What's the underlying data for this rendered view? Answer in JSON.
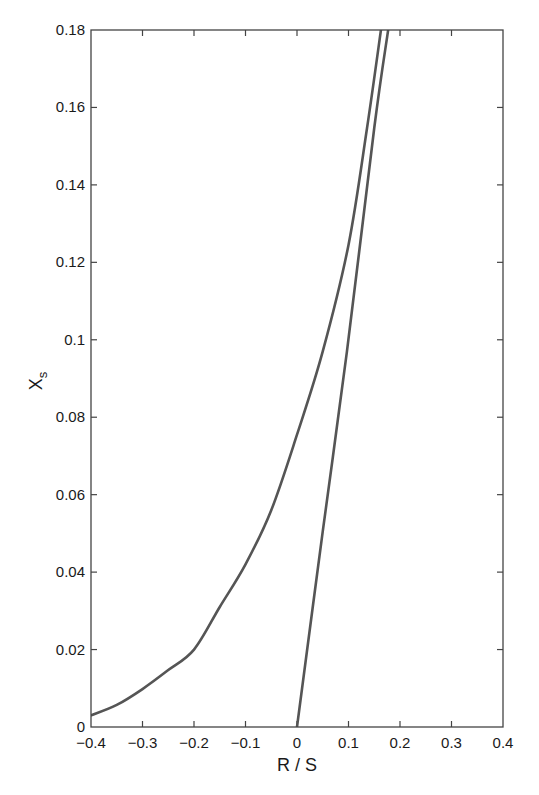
{
  "chart_data": {
    "type": "line",
    "title": "",
    "xlabel": "R / S",
    "ylabel": "X",
    "ylabel_subscript": "s",
    "xlim": [
      -0.4,
      0.4
    ],
    "ylim": [
      0,
      0.18
    ],
    "grid": false,
    "legend": null,
    "xticks": [
      -0.4,
      -0.3,
      -0.2,
      -0.1,
      0,
      0.1,
      0.2,
      0.3,
      0.4
    ],
    "xtick_labels": [
      "−0.4",
      "−0.3",
      "−0.2",
      "−0.1",
      "0",
      "0.1",
      "0.2",
      "0.3",
      "0.4"
    ],
    "yticks": [
      0,
      0.02,
      0.04,
      0.06,
      0.08,
      0.1,
      0.12,
      0.14,
      0.16,
      0.18
    ],
    "ytick_labels": [
      "0",
      "0.02",
      "0.04",
      "0.06",
      "0.08",
      "0.1",
      "0.12",
      "0.14",
      "0.16",
      "0.18"
    ],
    "series": [
      {
        "name": "curve",
        "color": "#555555",
        "x": [
          -0.4,
          -0.35,
          -0.3,
          -0.25,
          -0.2,
          -0.15,
          -0.1,
          -0.05,
          0,
          0.05,
          0.1,
          0.136,
          0.163
        ],
        "y": [
          0.003,
          0.0057,
          0.0098,
          0.0147,
          0.02,
          0.031,
          0.042,
          0.056,
          0.0755,
          0.097,
          0.1245,
          0.1547,
          0.18
        ]
      },
      {
        "name": "line",
        "color": "#555555",
        "x": [
          0,
          0.05,
          0.097,
          0.15,
          0.177
        ],
        "y": [
          0,
          0.0505,
          0.097,
          0.1547,
          0.18
        ]
      }
    ]
  }
}
